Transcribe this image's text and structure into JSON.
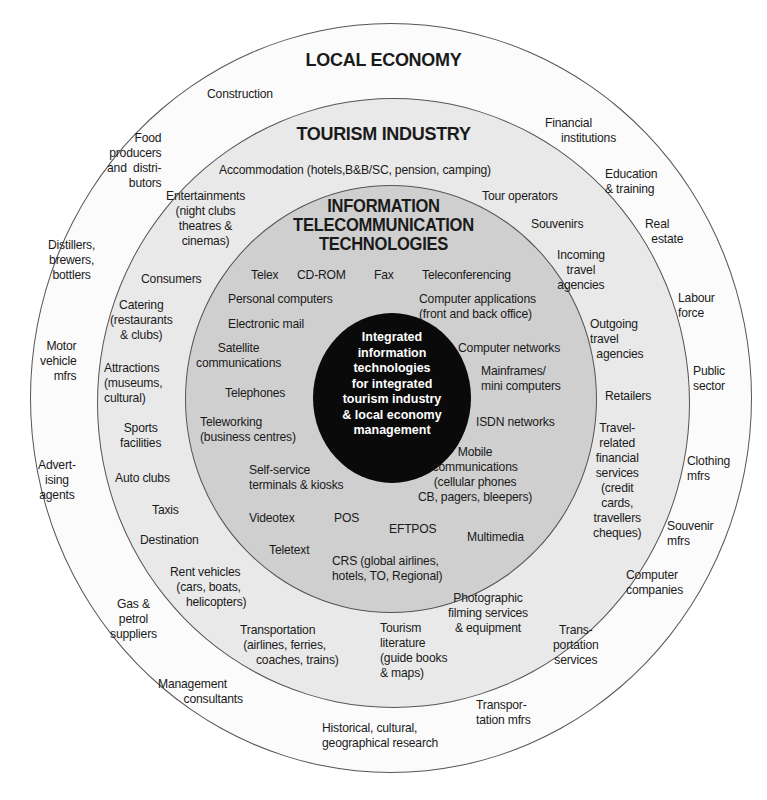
{
  "colors": {
    "background": "#ffffff",
    "local_economy_ring": "#fbfbfb",
    "tourism_ring": "#e9e9e9",
    "it_ring": "#cfcfcf",
    "core": "#0a0a0a",
    "core_text": "#ffffff",
    "ring_border": "#555555"
  },
  "rings": {
    "local_economy": {
      "title": "LOCAL ECONOMY",
      "items": [
        "Construction",
        "Food\nproducers\nand  distri-\nbutors",
        "Distillers,\nbrewers,\nbottlers",
        "Motor\nvehicle\nmfrs",
        "Advert-\nising\nagents",
        "Gas &\npetrol\nsuppliers",
        "Management\n        consultants",
        "Historical, cultural,\ngeographical research",
        "Transpor-\ntation mfrs",
        "Trans-\nportation\nservices",
        "Computer\ncompanies",
        "Souvenir\nmfrs",
        "Clothing\nmfrs",
        "Public\nsector",
        "Labour\nforce",
        "Real\n  estate",
        "Education\n& training",
        "Financial\n     institutions"
      ]
    },
    "tourism_industry": {
      "title": "TOURISM INDUSTRY",
      "items": [
        "Accommodation (hotels,B&B/SC, pension, camping)",
        "Entertainments\n(night clubs\ntheatres &\ncinemas)",
        "Consumers",
        "Catering\n(restaurants\n& clubs)",
        "Attractions\n(museums,\ncultural)",
        "Sports\nfacilities",
        "Auto clubs",
        "Taxis",
        "Destination",
        "Rent vehicles\n  (cars, boats,\n     helicopters)",
        "Transportation\n (airlines, ferries,\n     coaches, trains)",
        "Tourism\nliterature\n(guide books\n& maps)",
        "Photographic\nfilming services\n& equipment",
        "Travel-\nrelated\nfinancial\nservices\n(credit\ncards,\ntravellers\ncheques)",
        "Retailers",
        "Outgoing\ntravel\n  agencies",
        "Incoming\ntravel\nagencies",
        "Souvenirs",
        "Tour operators"
      ]
    },
    "information_technologies": {
      "title": "INFORMATION\nTELECOMMUNICATION\nTECHNOLOGIES",
      "items": [
        "Telex",
        "CD-ROM",
        "Fax",
        "Teleconferencing",
        "Personal computers",
        "Computer applications\n(front and back office)",
        "Electronic mail",
        "Satellite\ncommunications",
        "Computer networks",
        "Telephones",
        "Mainframes/\nmini computers",
        "Teleworking\n(business centres)",
        "ISDN networks",
        "Mobile\ncommunications\n(cellular phones\nCB, pagers, bleepers)",
        "Self-service\nterminals & kiosks",
        "Videotex",
        "POS",
        "EFTPOS",
        "Multimedia",
        "Teletext",
        "CRS (global airlines,\nhotels, TO, Regional)"
      ]
    },
    "core": {
      "text": "Integrated\ninformation\ntechnologies\nfor integrated\ntourism industry\n& local economy\nmanagement"
    }
  }
}
